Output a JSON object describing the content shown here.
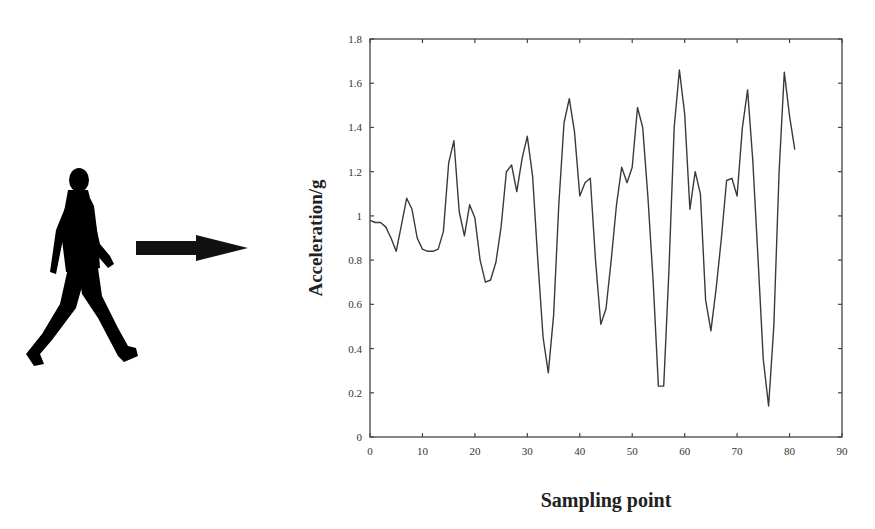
{
  "chart_data": {
    "type": "line",
    "title": "",
    "xlabel": "Sampling point",
    "ylabel": "Acceleration/g",
    "xlim": [
      0,
      90
    ],
    "ylim": [
      0,
      1.8
    ],
    "xticks": [
      "0",
      "10",
      "20",
      "30",
      "40",
      "50",
      "60",
      "70",
      "80",
      "90"
    ],
    "yticks": [
      "0",
      "0.2",
      "0.4",
      "0.6",
      "0.8",
      "1",
      "1.2",
      "1.4",
      "1.6",
      "1.8"
    ],
    "grid": false,
    "legend": null,
    "line_color": "#3a3a3a",
    "x": [
      0,
      1,
      2,
      3,
      4,
      5,
      6,
      7,
      8,
      9,
      10,
      11,
      12,
      13,
      14,
      15,
      16,
      17,
      18,
      19,
      20,
      21,
      22,
      23,
      24,
      25,
      26,
      27,
      28,
      29,
      30,
      31,
      32,
      33,
      34,
      35,
      36,
      37,
      38,
      39,
      40,
      41,
      42,
      43,
      44,
      45,
      46,
      47,
      48,
      49,
      50,
      51,
      52,
      53,
      54,
      55,
      56,
      57,
      58,
      59,
      60,
      61,
      62,
      63,
      64,
      65,
      66,
      67,
      68,
      69,
      70,
      71,
      72,
      73,
      74,
      75,
      76,
      77,
      78,
      79,
      80,
      81
    ],
    "series": [
      {
        "name": "Acceleration",
        "values": [
          0.98,
          0.97,
          0.97,
          0.95,
          0.9,
          0.84,
          0.96,
          1.08,
          1.03,
          0.9,
          0.85,
          0.84,
          0.84,
          0.85,
          0.93,
          1.24,
          1.34,
          1.02,
          0.91,
          1.05,
          0.99,
          0.8,
          0.7,
          0.71,
          0.79,
          0.95,
          1.2,
          1.23,
          1.11,
          1.26,
          1.36,
          1.18,
          0.8,
          0.45,
          0.29,
          0.55,
          1.05,
          1.42,
          1.53,
          1.38,
          1.09,
          1.15,
          1.17,
          0.8,
          0.51,
          0.58,
          0.8,
          1.05,
          1.22,
          1.15,
          1.22,
          1.49,
          1.4,
          1.08,
          0.7,
          0.23,
          0.23,
          0.75,
          1.4,
          1.66,
          1.46,
          1.03,
          1.2,
          1.1,
          0.62,
          0.48,
          0.67,
          0.9,
          1.16,
          1.17,
          1.09,
          1.4,
          1.57,
          1.25,
          0.8,
          0.35,
          0.14,
          0.5,
          1.2,
          1.65,
          1.45,
          1.3
        ]
      }
    ]
  },
  "illustration": {
    "figure": "walking-person-icon",
    "arrow": "right-arrow-icon"
  },
  "labels": {
    "xlabel": "Sampling point",
    "ylabel": "Acceleration/g"
  }
}
